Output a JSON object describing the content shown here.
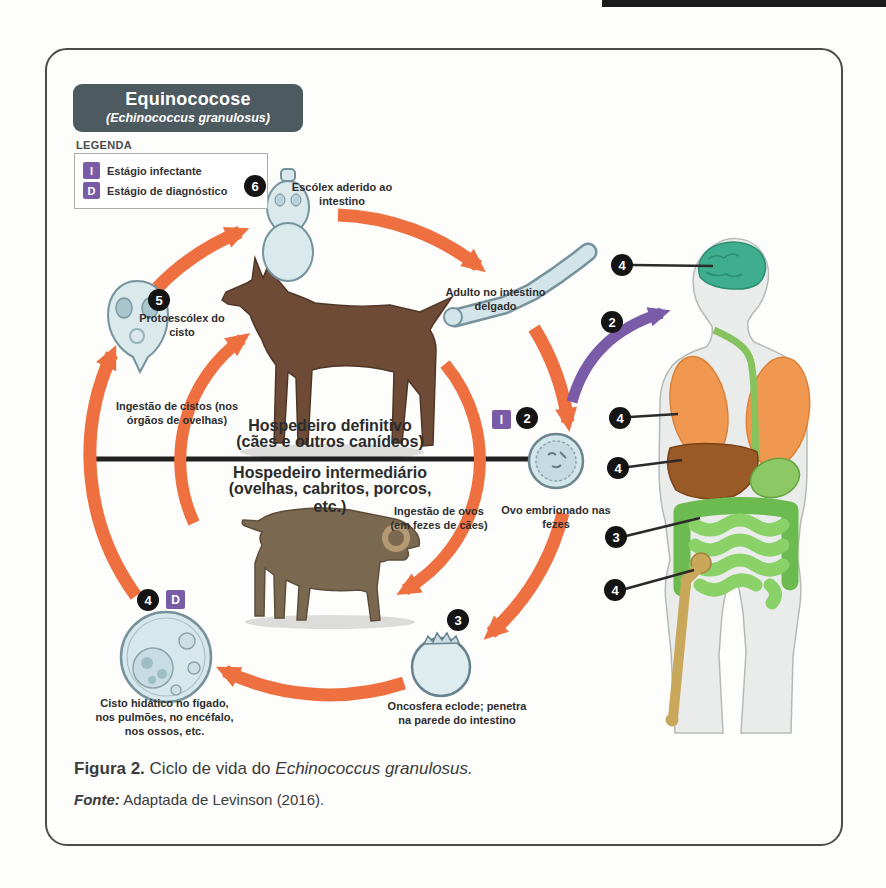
{
  "title_box": {
    "title": "Equinococose",
    "subtitle": "(Echinococcus granulosus)"
  },
  "legend": {
    "heading": "LEGENDA",
    "items": [
      {
        "badge": "I",
        "label": "Estágio infectante"
      },
      {
        "badge": "D",
        "label": "Estágio de diagnóstico"
      }
    ]
  },
  "cycle": {
    "stage6": {
      "number": "6",
      "label": "Escólex aderido ao intestino"
    },
    "adult_label": "Adulto no intestino delgado",
    "stage5": {
      "number": "5",
      "label": "Protoescólex do cisto"
    },
    "stage2": {
      "number": "2",
      "infect_badge": "I",
      "label": "Ovo embrionado nas fezes"
    },
    "stage3": {
      "number": "3",
      "label": "Oncosfera eclode; penetra na parede do intestino"
    },
    "stage4": {
      "number": "4",
      "diag_badge": "D",
      "label": "Cisto hidático no fígado, nos pulmões, no encéfalo, nos ossos, etc."
    },
    "transition_cysts": "Ingestão de cistos (nos órgãos de ovelhas)",
    "transition_eggs": "Ingestão de ovos (em fezes de cães)",
    "definitive_host": {
      "title": "Hospedeiro definitivo",
      "subtitle": "(cães e outros canídeos)"
    },
    "intermediate_host": {
      "title": "Hospedeiro intermediário",
      "subtitle": "(ovelhas, cabritos, porcos, etc.)"
    }
  },
  "human": {
    "markers": [
      {
        "number": "4",
        "target": "brain"
      },
      {
        "number": "2",
        "target": "mouth"
      },
      {
        "number": "4",
        "target": "lungs"
      },
      {
        "number": "4",
        "target": "liver"
      },
      {
        "number": "3",
        "target": "intestine"
      },
      {
        "number": "4",
        "target": "femur"
      }
    ]
  },
  "caption": {
    "figure_label": "Figura 2.",
    "figure_text": "Ciclo de vida do",
    "figure_species": "Echinococcus granulosus.",
    "source_label": "Fonte:",
    "source_text": "Adaptada de Levinson (2016)."
  },
  "colors": {
    "arrow_orange": "#ee7040",
    "accent_purple": "#7a5ba8",
    "title_bg": "#4d5a60",
    "badge_black": "#141414",
    "brain_teal": "#3fae8e",
    "lung_orange": "#f0984f",
    "liver_brown": "#9a5a28",
    "gut_green": "#6cbb50",
    "bone_tan": "#c9a75b"
  }
}
